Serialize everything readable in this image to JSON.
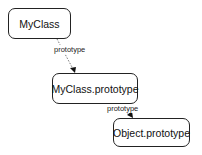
{
  "diagram": {
    "type": "prototype-chain",
    "nodes": [
      {
        "id": "myclass",
        "label": "MyClass"
      },
      {
        "id": "myclass-prototype",
        "label": "MyClass.prototype"
      },
      {
        "id": "object-prototype",
        "label": "Object.prototype"
      }
    ],
    "edges": [
      {
        "from": "myclass",
        "to": "myclass-prototype",
        "label": "prototype",
        "style": "dashed"
      },
      {
        "from": "myclass-prototype",
        "to": "object-prototype",
        "label": "prototype",
        "style": "dashed"
      }
    ]
  }
}
